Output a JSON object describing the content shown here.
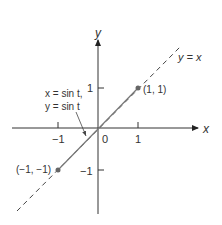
{
  "diagram": {
    "axes": {
      "x_label": "x",
      "y_label": "y",
      "origin_label": "0",
      "x_ticks": [
        "−1",
        "1"
      ],
      "y_ticks": [
        "1",
        "−1"
      ]
    },
    "lines": {
      "dashed_label": "y = x",
      "curve_label_line1": "x = sin t,",
      "curve_label_line2": "y = sin t"
    },
    "points": [
      {
        "label": "(1, 1)"
      },
      {
        "label": "(−1, −1)"
      }
    ],
    "colors": {
      "axis": "#333333",
      "segment": "#777777",
      "dashed": "#444444",
      "point": "#666666"
    }
  }
}
